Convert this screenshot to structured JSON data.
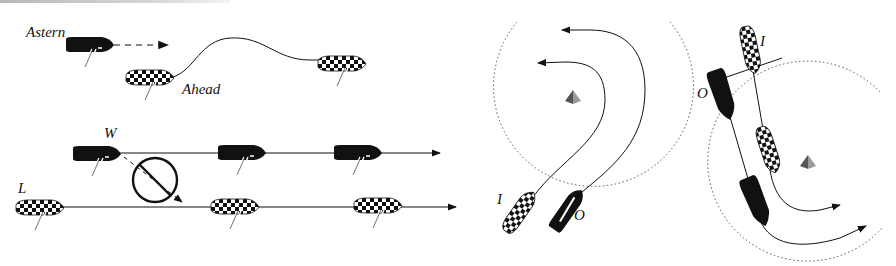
{
  "diagram": {
    "colors": {
      "ink": "#111111",
      "mark_light": "#9a9a9a",
      "mark_dark": "#555555",
      "zone_circle": "#555555",
      "top_bar": "#c0c0c0"
    },
    "panels": [
      {
        "id": "clear-astern-ahead",
        "labels": {
          "astern": "Astern",
          "ahead": "Ahead"
        },
        "boats": [
          {
            "role": "astern",
            "hull": "solid-black"
          },
          {
            "role": "ahead",
            "hull": "checkered",
            "positions": 2
          }
        ],
        "paths": [
          "dashed-arrow-from-astern",
          "curved-track-of-ahead"
        ]
      },
      {
        "id": "windward-leeward",
        "labels": {
          "windward": "W",
          "leeward": "L"
        },
        "boats": [
          {
            "role": "windward",
            "hull": "solid-black",
            "positions": 3
          },
          {
            "role": "leeward",
            "hull": "checkered",
            "positions": 3
          }
        ],
        "symbols": [
          "prohibited-circle-icon"
        ],
        "paths": [
          "windward-track-arrow",
          "leeward-track-arrow",
          "dashed-bear-away-arrow"
        ]
      },
      {
        "id": "mark-rounding-inside-outside",
        "labels": {
          "inside": "I",
          "outside": "O"
        },
        "boats": [
          {
            "role": "inside",
            "hull": "checkered"
          },
          {
            "role": "outside",
            "hull": "solid-black"
          }
        ],
        "symbols": [
          "mark-icon",
          "zone-circle"
        ],
        "paths": [
          "inside-rounding-arrow",
          "outside-rounding-arrow"
        ]
      },
      {
        "id": "overlap-at-zone",
        "labels": {
          "inside": "I",
          "outside": "O"
        },
        "boats": [
          {
            "role": "inside",
            "hull": "checkered",
            "positions": 2
          },
          {
            "role": "outside",
            "hull": "solid-black",
            "positions": 2
          }
        ],
        "symbols": [
          "mark-icon",
          "zone-circle",
          "overlap-line"
        ],
        "paths": [
          "inside-rounding-arrow",
          "outside-rounding-arrow"
        ]
      }
    ]
  }
}
